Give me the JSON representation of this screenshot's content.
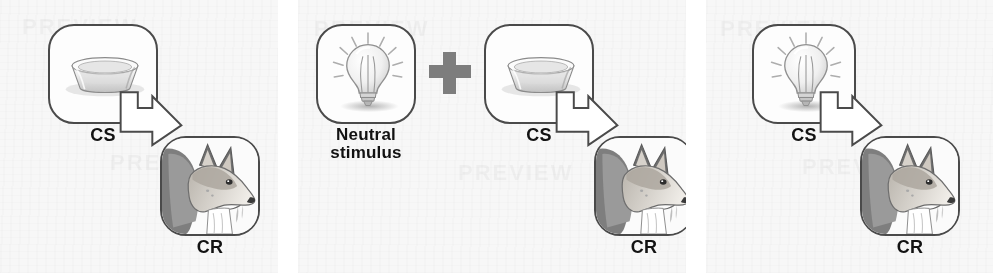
{
  "figure": {
    "background_color": "#ffffff",
    "panel_background_color": "#f7f7f7",
    "ink_color": "#4a4a4a",
    "text_color": "#121212",
    "plus_color": "#7d7d7d"
  },
  "panels": [
    {
      "id": "panel-before-conditioning",
      "stimulus": {
        "icon": "dog-food-bowl-icon",
        "label": "CS"
      },
      "response": {
        "icon": "salivating-dog-icon",
        "label": "CR"
      },
      "connector": {
        "icon": "block-arrow-icon"
      }
    },
    {
      "id": "panel-during-conditioning",
      "neutral": {
        "icon": "light-bulb-icon",
        "label": "Neutral\nstimulus"
      },
      "operator": {
        "icon": "plus-icon",
        "label": "+"
      },
      "stimulus": {
        "icon": "dog-food-bowl-icon",
        "label": "CS"
      },
      "response": {
        "icon": "salivating-dog-icon",
        "label": "CR"
      },
      "connector": {
        "icon": "block-arrow-icon"
      }
    },
    {
      "id": "panel-after-conditioning",
      "stimulus": {
        "icon": "light-bulb-icon",
        "label": "CS"
      },
      "response": {
        "icon": "salivating-dog-icon",
        "label": "CR"
      },
      "connector": {
        "icon": "block-arrow-icon"
      }
    }
  ]
}
